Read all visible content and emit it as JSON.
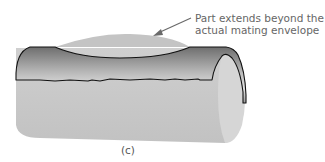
{
  "figure": {
    "callout": {
      "line1": "Part extends beyond the",
      "line2": "actual mating envelope"
    },
    "caption": "(c)",
    "colors": {
      "cylinder_body": "#c9c9c9",
      "end_cap": "#d6d6d6",
      "envelope_dark": "#6e6e6e",
      "envelope_light": "#e2e2e2",
      "outline": "#111111",
      "arrow": "#6a6a6a",
      "text": "#666666"
    }
  }
}
